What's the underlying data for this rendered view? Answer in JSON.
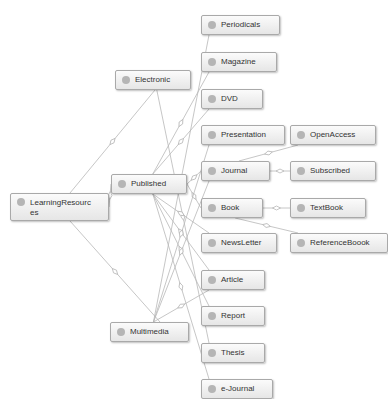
{
  "diagram": {
    "nodes": [
      {
        "id": "learning",
        "label": "LearningResources",
        "x": 10,
        "y": 193,
        "w": 85,
        "h": 28
      },
      {
        "id": "electronic",
        "label": "Electronic",
        "x": 115,
        "y": 70,
        "w": 62,
        "h": 16
      },
      {
        "id": "published",
        "label": "Published",
        "x": 111,
        "y": 174,
        "w": 62,
        "h": 16
      },
      {
        "id": "multimedia",
        "label": "Multimedia",
        "x": 110,
        "y": 322,
        "w": 65,
        "h": 16
      },
      {
        "id": "periodicals",
        "label": "Periodicals",
        "x": 201,
        "y": 15,
        "w": 65,
        "h": 16
      },
      {
        "id": "magazine",
        "label": "Magazine",
        "x": 201,
        "y": 52,
        "w": 62,
        "h": 16
      },
      {
        "id": "dvd",
        "label": "DVD",
        "x": 201,
        "y": 89,
        "w": 48,
        "h": 16
      },
      {
        "id": "presentation",
        "label": "Presentation",
        "x": 201,
        "y": 125,
        "w": 70,
        "h": 16
      },
      {
        "id": "journal",
        "label": "Journal",
        "x": 201,
        "y": 161,
        "w": 55,
        "h": 16
      },
      {
        "id": "book",
        "label": "Book",
        "x": 201,
        "y": 198,
        "w": 48,
        "h": 16
      },
      {
        "id": "newsletter",
        "label": "NewsLetter",
        "x": 201,
        "y": 233,
        "w": 62,
        "h": 16
      },
      {
        "id": "article",
        "label": "Article",
        "x": 201,
        "y": 270,
        "w": 50,
        "h": 16
      },
      {
        "id": "report",
        "label": "Report",
        "x": 201,
        "y": 306,
        "w": 50,
        "h": 16
      },
      {
        "id": "thesis",
        "label": "Thesis",
        "x": 201,
        "y": 343,
        "w": 50,
        "h": 16
      },
      {
        "id": "ejournal",
        "label": "e-Journal",
        "x": 201,
        "y": 379,
        "w": 58,
        "h": 16
      },
      {
        "id": "openaccess",
        "label": "OpenAccess",
        "x": 290,
        "y": 125,
        "w": 72,
        "h": 16
      },
      {
        "id": "subscribed",
        "label": "Subscribed",
        "x": 290,
        "y": 161,
        "w": 72,
        "h": 16
      },
      {
        "id": "textbook",
        "label": "TextBook",
        "x": 290,
        "y": 198,
        "w": 62,
        "h": 16
      },
      {
        "id": "referencebook",
        "label": "ReferenceBoook",
        "x": 290,
        "y": 233,
        "w": 84,
        "h": 16
      }
    ],
    "edges": [
      {
        "from": "learning",
        "to": "electronic"
      },
      {
        "from": "learning",
        "to": "published"
      },
      {
        "from": "learning",
        "to": "multimedia"
      },
      {
        "from": "electronic",
        "to": "thesis"
      },
      {
        "from": "published",
        "to": "magazine"
      },
      {
        "from": "published",
        "to": "dvd"
      },
      {
        "from": "published",
        "to": "journal"
      },
      {
        "from": "published",
        "to": "book"
      },
      {
        "from": "published",
        "to": "newsletter"
      },
      {
        "from": "published",
        "to": "article"
      },
      {
        "from": "published",
        "to": "report"
      },
      {
        "from": "published",
        "to": "ejournal"
      },
      {
        "from": "multimedia",
        "to": "periodicals"
      },
      {
        "from": "multimedia",
        "to": "presentation"
      },
      {
        "from": "multimedia",
        "to": "journal"
      },
      {
        "from": "multimedia",
        "to": "article"
      },
      {
        "from": "journal",
        "to": "openaccess"
      },
      {
        "from": "journal",
        "to": "subscribed"
      },
      {
        "from": "book",
        "to": "textbook"
      },
      {
        "from": "book",
        "to": "referencebook"
      }
    ],
    "colors": {
      "edge": "#b8b8b8",
      "node_border": "#a9a9a9",
      "node_dot": "#b5b5b5",
      "text": "#333333"
    }
  }
}
